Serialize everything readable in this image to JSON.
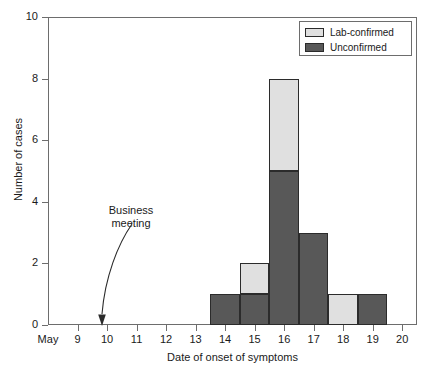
{
  "chart_data": {
    "type": "bar",
    "title": "",
    "xlabel": "Date of onset of symptoms",
    "ylabel": "Number of cases",
    "xlim": [
      8.0,
      20.5
    ],
    "ylim": [
      0,
      10
    ],
    "yticks": [
      0,
      2,
      4,
      6,
      8,
      10
    ],
    "xticks": [
      "May",
      "9",
      "10",
      "11",
      "12",
      "13",
      "14",
      "15",
      "16",
      "17",
      "18",
      "19",
      "20"
    ],
    "grid": false,
    "stacked": true,
    "legend_position": "top-right",
    "categories": [
      "14",
      "15",
      "16",
      "17",
      "18",
      "19"
    ],
    "series": [
      {
        "name": "Unconfirmed",
        "color": "#585858",
        "values": [
          1,
          1,
          5,
          3,
          0,
          1
        ]
      },
      {
        "name": "Lab-confirmed",
        "color": "#e0e0e0",
        "values": [
          0,
          1,
          3,
          0,
          1,
          0
        ]
      }
    ],
    "totals": [
      1,
      2,
      8,
      3,
      1,
      1
    ],
    "annotations": [
      {
        "text": "Business meeting",
        "line1": "Business",
        "line2": "meeting",
        "points_to_x": 9.5,
        "points_to_y": 0
      }
    ]
  },
  "legend": {
    "items": [
      {
        "label": "Lab-confirmed",
        "color": "#e0e0e0"
      },
      {
        "label": "Unconfirmed",
        "color": "#585858"
      }
    ]
  },
  "axes": {
    "y_title": "Number of cases",
    "x_title": "Date of onset of symptoms",
    "y_tick_labels": [
      "0",
      "2",
      "4",
      "6",
      "8",
      "10"
    ],
    "x_tick_labels": [
      "May",
      "9",
      "10",
      "11",
      "12",
      "13",
      "14",
      "15",
      "16",
      "17",
      "18",
      "19",
      "20"
    ]
  },
  "annotation": {
    "line1": "Business",
    "line2": "meeting"
  },
  "colors": {
    "lab_confirmed": "#e0e0e0",
    "unconfirmed": "#585858",
    "axis": "#6d6d6d",
    "bar_border": "#2b2b2b",
    "background": "#ffffff"
  }
}
